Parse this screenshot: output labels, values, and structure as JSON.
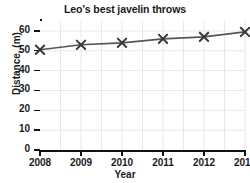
{
  "chart_data": {
    "type": "line",
    "title": "Leo's best javelin throws",
    "xlabel": "Year",
    "ylabel": "Distance, (m)",
    "categories": [
      "2008",
      "2009",
      "2010",
      "2011",
      "2012",
      "2013"
    ],
    "x": [
      2008,
      2009,
      2010,
      2011,
      2012,
      2013
    ],
    "values": [
      50.5,
      53,
      54,
      56,
      57,
      59.5
    ],
    "series": [
      {
        "name": "Best javelin throw",
        "values": [
          50.5,
          53,
          54,
          56,
          57,
          59.5
        ]
      }
    ],
    "xlim": [
      2008,
      2013
    ],
    "ylim": [
      0,
      65
    ],
    "y_ticks": [
      0,
      10,
      20,
      30,
      40,
      50,
      60
    ],
    "y_tick_labels": [
      "0",
      "10",
      "20",
      "30",
      "40",
      "50",
      "60"
    ],
    "x_ticks": [
      2008,
      2009,
      2010,
      2011,
      2012,
      2013
    ],
    "x_tick_labels": [
      "2008",
      "2009",
      "2010",
      "2011",
      "2012",
      "2013"
    ],
    "grid": true,
    "grid_minor_vertical": true,
    "legend": false,
    "legend_position": "none",
    "marker": "x",
    "line_color": "#555555",
    "marker_color": "#3a3a3a",
    "grid_color": "#e8e8e8",
    "axis_color": "#111111",
    "background_color": "#ffffff"
  }
}
